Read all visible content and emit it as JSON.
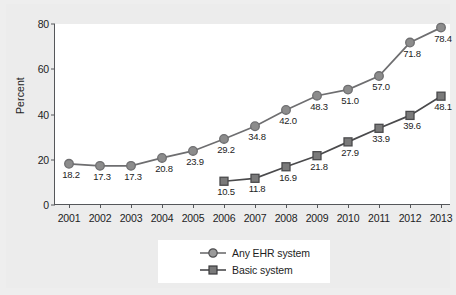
{
  "chart_data": {
    "type": "line",
    "title": "",
    "xlabel": "",
    "ylabel": "Percent",
    "ylim": [
      0,
      80
    ],
    "yticks": [
      0,
      20,
      40,
      60,
      80
    ],
    "grid": false,
    "legend_position": "bottom",
    "categories": [
      "2001",
      "2002",
      "2003",
      "2004",
      "2005",
      "2006",
      "2007",
      "2008",
      "2009",
      "2010",
      "2011",
      "2012",
      "2013"
    ],
    "series": [
      {
        "name": "Any EHR system",
        "marker": "circle",
        "color": "#8c8c8c",
        "line_color": "#6e6e70",
        "values": [
          18.2,
          17.3,
          17.3,
          20.8,
          23.9,
          29.2,
          34.8,
          42.0,
          48.3,
          51.0,
          57.0,
          71.8,
          78.4
        ],
        "labels": [
          "18.2",
          "17.3",
          "17.3",
          "20.8",
          "23.9",
          "29.2",
          "34.8",
          "42.0",
          "48.3",
          "51.0",
          "57.0",
          "71.8",
          "78.4"
        ]
      },
      {
        "name": "Basic system",
        "marker": "square",
        "color": "#7a7a7a",
        "line_color": "#4a4a4c",
        "values": [
          null,
          null,
          null,
          null,
          null,
          10.5,
          11.8,
          16.9,
          21.8,
          27.9,
          33.9,
          39.6,
          48.1
        ],
        "labels": [
          "",
          "",
          "",
          "",
          "",
          "10.5",
          "11.8",
          "16.9",
          "21.8",
          "27.9",
          "33.9",
          "39.6",
          "48.1"
        ]
      }
    ]
  },
  "legend": {
    "items": [
      {
        "label": "Any EHR system"
      },
      {
        "label": "Basic system"
      }
    ]
  },
  "axis": {
    "y_title": "Percent",
    "y_tick_labels": [
      "0",
      "20",
      "40",
      "60",
      "80"
    ],
    "x_tick_labels": [
      "2001",
      "2002",
      "2003",
      "2004",
      "2005",
      "2006",
      "2007",
      "2008",
      "2009",
      "2010",
      "2011",
      "2012",
      "2013"
    ]
  },
  "colors": {
    "page_background": "#ececec",
    "plot_background": "#ffffff",
    "axis": "#55575a",
    "series1": "#8c8c8c",
    "series2": "#7a7a7a",
    "text": "#1d1d1d"
  }
}
